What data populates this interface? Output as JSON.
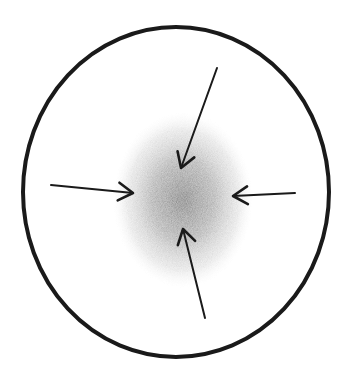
{
  "diagram": {
    "title": "",
    "colors": {
      "background": "#ffffff",
      "stroke": "#1a1a1a",
      "blob": "#9a9a9a"
    },
    "boundary": {
      "shape": "ellipse",
      "cx": 176,
      "cy": 192,
      "rx": 153,
      "ry": 165,
      "stroke_width": 4
    },
    "center_blob": {
      "cx": 183,
      "cy": 200,
      "rx": 70,
      "ry": 88
    },
    "arrows": [
      {
        "name": "arrow-from-top",
        "x1": 217,
        "y1": 68,
        "x2": 181,
        "y2": 168
      },
      {
        "name": "arrow-from-left",
        "x1": 51,
        "y1": 185,
        "x2": 133,
        "y2": 193
      },
      {
        "name": "arrow-from-right",
        "x1": 295,
        "y1": 193,
        "x2": 233,
        "y2": 196
      },
      {
        "name": "arrow-from-bottom",
        "x1": 205,
        "y1": 318,
        "x2": 183,
        "y2": 229
      }
    ]
  }
}
